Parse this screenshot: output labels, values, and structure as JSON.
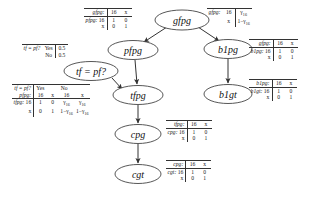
{
  "figure": {
    "type": "bayesian-network-with-cpts",
    "nodes": [
      {
        "id": "gfpg",
        "label": "gfpg",
        "cx": 182,
        "cy": 20,
        "rx": 27,
        "ry": 10
      },
      {
        "id": "pfpg",
        "label": "pfpg",
        "cx": 133,
        "cy": 50,
        "rx": 25,
        "ry": 9.5
      },
      {
        "id": "b1pg",
        "label": "b1pg",
        "cx": 228,
        "cy": 49,
        "rx": 24,
        "ry": 9.5
      },
      {
        "id": "tfpq",
        "label": "tf = pf?",
        "cx": 91,
        "cy": 71,
        "rx": 27,
        "ry": 9.5
      },
      {
        "id": "tfpg",
        "label": "tfpg",
        "cx": 138,
        "cy": 95,
        "rx": 25,
        "ry": 9.5
      },
      {
        "id": "b1gt",
        "label": "b1gt",
        "cx": 228,
        "cy": 94,
        "rx": 24,
        "ry": 9.5
      },
      {
        "id": "cpg",
        "label": "cpg",
        "cx": 138,
        "cy": 134,
        "rx": 23,
        "ry": 9.5
      },
      {
        "id": "cgt",
        "label": "cgt",
        "cx": 138,
        "cy": 174,
        "rx": 23,
        "ry": 9.5
      }
    ],
    "edges": [
      {
        "from": "gfpg",
        "to": "pfpg"
      },
      {
        "from": "gfpg",
        "to": "b1pg"
      },
      {
        "from": "pfpg",
        "to": "tfpg"
      },
      {
        "from": "tfpq",
        "to": "tfpg"
      },
      {
        "from": "b1pg",
        "to": "b1gt"
      },
      {
        "from": "tfpg",
        "to": "cpg"
      },
      {
        "from": "cpg",
        "to": "cgt"
      }
    ]
  },
  "tables": {
    "gfpg_prior": {
      "name": "gfpg-prior-table",
      "header_label": "gfpg:",
      "header_cols": [
        "16",
        "x"
      ],
      "values": [
        "γ",
        "1−γ"
      ],
      "subscripts": [
        "16",
        "16"
      ]
    },
    "pfpg_cpt": {
      "name": "pfpg-cpt-table",
      "parent_label": "gfpg:",
      "parent_cols": [
        "16",
        "x"
      ],
      "rows": [
        {
          "label": "pfpg:",
          "state": "16",
          "cells": [
            "1",
            "0"
          ]
        },
        {
          "label": "",
          "state": "x",
          "cells": [
            "0",
            "1"
          ]
        }
      ]
    },
    "b1pg_cpt": {
      "name": "b1pg-cpt-table",
      "parent_label": "gfpg:",
      "parent_cols": [
        "16",
        "x"
      ],
      "rows": [
        {
          "label": "b1pg:",
          "state": "16",
          "cells": [
            "1",
            "0"
          ]
        },
        {
          "label": "",
          "state": "x",
          "cells": [
            "0",
            "1"
          ]
        }
      ]
    },
    "b1gt_cpt": {
      "name": "b1gt-cpt-table",
      "parent_label": "b1pg:",
      "parent_cols": [
        "16",
        "x"
      ],
      "rows": [
        {
          "label": "b1gt:",
          "state": "16",
          "cells": [
            "1",
            "0"
          ]
        },
        {
          "label": "",
          "state": "x",
          "cells": [
            "0",
            "1"
          ]
        }
      ]
    },
    "tfpq_prior": {
      "name": "tf-equals-pf-prior-table",
      "header_label": "tf = pf?",
      "rows": [
        {
          "state": "Yes",
          "value": "0.5"
        },
        {
          "state": "No",
          "value": "0.5"
        }
      ]
    },
    "tfpg_cpt": {
      "name": "tfpg-cpt-table",
      "parent1_label": "tf = pf?",
      "parent1_cols": [
        "Yes",
        "No"
      ],
      "parent2_label": "pfpg:",
      "parent2_cols": [
        "16",
        "x",
        "16",
        "x"
      ],
      "rows": [
        {
          "label": "tfpg:",
          "state": "16",
          "cells": [
            "1",
            "0",
            "γ",
            "γ"
          ],
          "subs": [
            "",
            "",
            "16",
            "16"
          ]
        },
        {
          "label": "",
          "state": "x",
          "cells": [
            "0",
            "1",
            "1−γ",
            "1−γ"
          ],
          "subs": [
            "",
            "",
            "16",
            "16"
          ]
        }
      ]
    },
    "cpg_cpt": {
      "name": "cpg-cpt-table",
      "parent_label": "tfpg:",
      "parent_cols": [
        "16",
        "x"
      ],
      "rows": [
        {
          "label": "cpg:",
          "state": "16",
          "cells": [
            "1",
            "0"
          ]
        },
        {
          "label": "",
          "state": "x",
          "cells": [
            "0",
            "1"
          ]
        }
      ]
    },
    "cgt_cpt": {
      "name": "cgt-cpt-table",
      "parent_label": "cpg:",
      "parent_cols": [
        "16",
        "x"
      ],
      "rows": [
        {
          "label": "cgt:",
          "state": "16",
          "cells": [
            "1",
            "0"
          ]
        },
        {
          "label": "",
          "state": "x",
          "cells": [
            "0",
            "1"
          ]
        }
      ]
    }
  },
  "colors": {
    "background": "#ffffff",
    "stroke": "#333333",
    "text": "#1a1a1a"
  }
}
